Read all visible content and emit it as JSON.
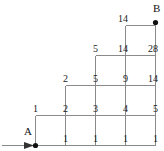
{
  "figure": {
    "type": "lattice-path-staircase-diagram",
    "stroke_color": "#8a8a8a",
    "text_color": "#1a1a1a",
    "background": "#ffffff",
    "points": {
      "start": {
        "label": "A",
        "x": 35,
        "y": 145
      },
      "end": {
        "label": "B",
        "x": 155,
        "y": 22
      }
    },
    "arrow": {
      "from_x": 2,
      "to_x": 35,
      "y": 145
    },
    "grid": {
      "x_lines": [
        35,
        65,
        95,
        125,
        155
      ],
      "y_lines": [
        145,
        115,
        85,
        55,
        25
      ],
      "cell_w": 30,
      "cell_h": 30
    },
    "rows": [
      {
        "name": "row-top",
        "y": 20,
        "values": [
          {
            "text": "14",
            "x": 125
          }
        ]
      },
      {
        "name": "row-4",
        "y": 50,
        "values": [
          {
            "text": "5",
            "x": 95
          },
          {
            "text": "14",
            "x": 125
          },
          {
            "text": "28",
            "x": 155
          }
        ]
      },
      {
        "name": "row-3",
        "y": 80,
        "values": [
          {
            "text": "2",
            "x": 65
          },
          {
            "text": "5",
            "x": 95
          },
          {
            "text": "9",
            "x": 125
          },
          {
            "text": "14",
            "x": 155
          }
        ]
      },
      {
        "name": "row-2",
        "y": 110,
        "values": [
          {
            "text": "1",
            "x": 35
          },
          {
            "text": "2",
            "x": 65
          },
          {
            "text": "3",
            "x": 95
          },
          {
            "text": "4",
            "x": 125
          },
          {
            "text": "5",
            "x": 155
          }
        ]
      },
      {
        "name": "row-base",
        "y": 140,
        "values": [
          {
            "text": "1",
            "x": 65
          },
          {
            "text": "1",
            "x": 95
          },
          {
            "text": "1",
            "x": 125
          },
          {
            "text": "1",
            "x": 155
          }
        ]
      }
    ]
  }
}
